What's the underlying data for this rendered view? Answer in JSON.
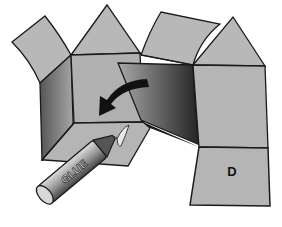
{
  "diagram": {
    "face_label": "D",
    "glue_label": "GLUE",
    "arrow": "fold-direction-arrow",
    "colors": {
      "paper": "#b5b5b5",
      "outline": "#1a1a1a",
      "shadow": "#3a3a3a",
      "background": "#ffffff"
    }
  }
}
